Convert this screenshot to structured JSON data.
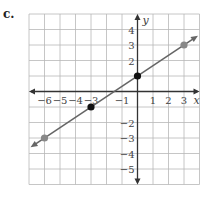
{
  "problem_label": "c.",
  "chart_data": {
    "type": "line",
    "title": "",
    "xlabel": "x",
    "ylabel": "y",
    "xlim": [
      -7,
      4
    ],
    "ylim": [
      -6,
      5
    ],
    "grid": true,
    "x_tick_labels": [
      "−6",
      "−5",
      "−4",
      "−3",
      "−1",
      "1",
      "2",
      "3"
    ],
    "x_tick_values": [
      -6,
      -5,
      -4,
      -3,
      -1,
      1,
      2,
      3
    ],
    "y_tick_labels": [
      "4",
      "3",
      "2",
      "−2",
      "−3",
      "−4",
      "−5"
    ],
    "y_tick_values": [
      4,
      3,
      2,
      -2,
      -3,
      -4,
      -5
    ],
    "series": [
      {
        "name": "line",
        "slope": 0.6667,
        "intercept": 1,
        "points": [
          {
            "x": -6,
            "y": -3,
            "color": "#888888"
          },
          {
            "x": -3,
            "y": -1,
            "color": "#111111"
          },
          {
            "x": 0,
            "y": 1,
            "color": "#111111"
          },
          {
            "x": 3,
            "y": 3,
            "color": "#888888"
          }
        ],
        "line_color": "#666666"
      }
    ]
  }
}
